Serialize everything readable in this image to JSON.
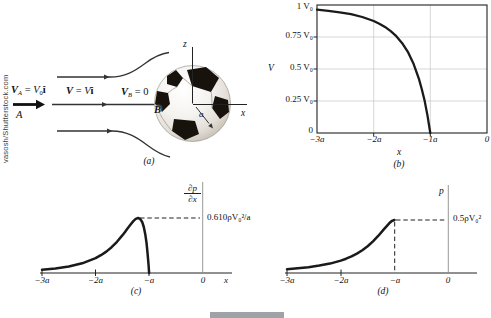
{
  "credit": "vasosh/Shutterstock.com",
  "colors": {
    "curve": "#1a1a1a",
    "grid": "#c6c6c6",
    "gray_axis": "#8c8c8c",
    "streamline": "#333333",
    "footer_bar": "#9ea3a7"
  },
  "panel_a": {
    "caption": "(a)",
    "va": {
      "v": "V",
      "sub": "A",
      "mid": " = ",
      "v2": "V",
      "sub2": "0",
      "hat": "î"
    },
    "v": {
      "v": "V",
      "mid": " = ",
      "v2": "V",
      "hat": "î"
    },
    "vb": {
      "v": "V",
      "sub": "B",
      "rest": " = 0"
    },
    "point_a": "A",
    "point_b": "B",
    "axis_z": "z",
    "axis_x": "x",
    "radius_label": "a"
  },
  "panel_b": {
    "caption": "(b)",
    "ylabel": "V",
    "xlabel": "x",
    "yticks": [
      "1 V₀",
      "0.75 V₀",
      "0.5 V₀",
      "0.25 V₀",
      "0"
    ],
    "xticks": [
      "−3a",
      "−2a",
      "−1a",
      "0"
    ]
  },
  "panel_c": {
    "caption": "(c)",
    "ylabel_num": "∂p",
    "ylabel_den": "∂x",
    "xlabel": "x",
    "peak_label": "0.610ρV₀²/a",
    "xticks": [
      "−3a",
      "−2a",
      "−a",
      "0"
    ]
  },
  "panel_d": {
    "caption": "(d)",
    "ylabel": "p",
    "peak_label": "0.5ρV₀²",
    "xticks": [
      "−3a",
      "−2a",
      "−a",
      "0"
    ]
  },
  "chart_data": [
    {
      "id": "b",
      "type": "line",
      "title": "Velocity along stagnation streamline",
      "xlabel": "x",
      "ylabel": "V",
      "x_tick_labels": [
        "−3a",
        "−2a",
        "−1a",
        "0"
      ],
      "y_tick_labels": [
        "0",
        "0.25 V₀",
        "0.5 V₀",
        "0.75 V₀",
        "1 V₀"
      ],
      "xlim": [
        -3,
        0
      ],
      "ylim": [
        0,
        1
      ],
      "grid": true,
      "x": [
        -3,
        -2.8,
        -2.6,
        -2.4,
        -2.2,
        -2.0,
        -1.9,
        -1.8,
        -1.7,
        -1.6,
        -1.5,
        -1.4,
        -1.3,
        -1.2,
        -1.15,
        -1.1,
        -1.05,
        -1.0
      ],
      "y": [
        0.963,
        0.954,
        0.943,
        0.928,
        0.906,
        0.875,
        0.854,
        0.829,
        0.796,
        0.756,
        0.704,
        0.636,
        0.545,
        0.421,
        0.342,
        0.249,
        0.136,
        0
      ]
    },
    {
      "id": "c",
      "type": "line",
      "title": "Pressure gradient along stagnation streamline",
      "xlabel": "x",
      "ylabel": "∂p/∂x",
      "x_tick_labels": [
        "−3a",
        "−2a",
        "−a",
        "0"
      ],
      "peak_annotation": {
        "label": "0.610ρV₀²/a",
        "x": -1.205,
        "y": 0.61
      },
      "xlim": [
        -3,
        0
      ],
      "ylim": [
        0,
        1
      ],
      "grid": false,
      "x": [
        -3,
        -2.75,
        -2.5,
        -2.25,
        -2.0,
        -1.9,
        -1.8,
        -1.7,
        -1.6,
        -1.5,
        -1.45,
        -1.4,
        -1.35,
        -1.3,
        -1.25,
        -1.205,
        -1.17,
        -1.13,
        -1.1,
        -1.07,
        -1.05,
        -1.03,
        -1.01,
        -1.0
      ],
      "y": [
        0.036,
        0.05,
        0.072,
        0.107,
        0.164,
        0.197,
        0.237,
        0.286,
        0.346,
        0.417,
        0.456,
        0.497,
        0.536,
        0.572,
        0.6,
        0.61,
        0.601,
        0.565,
        0.51,
        0.42,
        0.336,
        0.226,
        0.085,
        0
      ]
    },
    {
      "id": "d",
      "type": "line",
      "title": "Pressure along stagnation streamline",
      "xlabel": "x",
      "ylabel": "p",
      "x_tick_labels": [
        "−3a",
        "−2a",
        "−a",
        "0"
      ],
      "peak_annotation": {
        "label": "0.5ρV₀²",
        "x": -1,
        "y": 0.5
      },
      "xlim": [
        -3,
        0
      ],
      "ylim": [
        0,
        1
      ],
      "grid": false,
      "x": [
        -3,
        -2.8,
        -2.6,
        -2.4,
        -2.2,
        -2.0,
        -1.9,
        -1.8,
        -1.7,
        -1.6,
        -1.5,
        -1.4,
        -1.3,
        -1.2,
        -1.1,
        -1.05,
        -1.0
      ],
      "y": [
        0.036,
        0.044,
        0.055,
        0.07,
        0.089,
        0.117,
        0.135,
        0.157,
        0.183,
        0.214,
        0.252,
        0.298,
        0.352,
        0.411,
        0.469,
        0.491,
        0.5
      ]
    }
  ]
}
